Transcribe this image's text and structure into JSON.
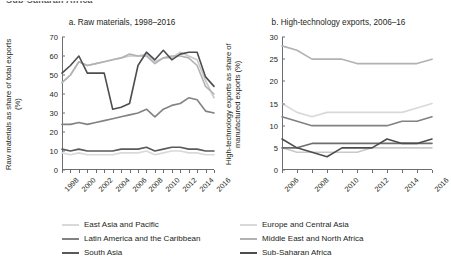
{
  "header": {
    "cropped_text": "Sub-Saharan Africa"
  },
  "chart_data": [
    {
      "type": "line",
      "panel": "a",
      "title": "a. Raw materials, 1998–2016",
      "xlabel": "",
      "ylabel": "Raw materials as share of total exports (%)",
      "ylim": [
        0,
        70
      ],
      "yticks": [
        0,
        10,
        20,
        30,
        40,
        50,
        60,
        70
      ],
      "xlim": [
        1998,
        2016
      ],
      "xticks": [
        1998,
        2000,
        2002,
        2004,
        2006,
        2008,
        2010,
        2012,
        2014,
        2016
      ],
      "x": [
        1998,
        1999,
        2000,
        2001,
        2002,
        2003,
        2004,
        2005,
        2006,
        2007,
        2008,
        2009,
        2010,
        2011,
        2012,
        2013,
        2014,
        2015,
        2016
      ],
      "grid": false,
      "legend_position": "bottom",
      "series": [
        {
          "name": "East Asia and Pacific",
          "color": "#d9d9d9",
          "values": [
            9,
            8,
            9,
            8,
            8,
            8,
            8,
            9,
            9,
            9,
            10,
            8,
            9,
            10,
            10,
            9,
            9,
            8,
            8
          ]
        },
        {
          "name": "Europe and Central Asia",
          "color": "#c8c9ca",
          "values": [
            46,
            50,
            57,
            55,
            56,
            57,
            58,
            59,
            60,
            60,
            61,
            57,
            59,
            59,
            62,
            60,
            58,
            47,
            38
          ]
        },
        {
          "name": "Latin America and the Caribbean",
          "color": "#808285",
          "values": [
            24,
            24,
            25,
            24,
            25,
            26,
            27,
            28,
            29,
            30,
            32,
            28,
            32,
            34,
            35,
            38,
            37,
            31,
            30
          ]
        },
        {
          "name": "Middle East and North Africa",
          "color": "#b0b2b4",
          "values": [
            46,
            50,
            57,
            55,
            56,
            57,
            58,
            59,
            61,
            60,
            60,
            56,
            59,
            60,
            60,
            59,
            55,
            44,
            40
          ]
        },
        {
          "name": "South Asia",
          "color": "#58595b",
          "values": [
            11,
            10,
            11,
            10,
            10,
            10,
            10,
            11,
            11,
            11,
            12,
            10,
            11,
            12,
            12,
            11,
            11,
            10,
            10
          ]
        },
        {
          "name": "Sub-Saharan Africa",
          "color": "#4d4d4f",
          "values": [
            51,
            55,
            60,
            51,
            51,
            51,
            32,
            33,
            35,
            55,
            62,
            58,
            63,
            58,
            61,
            62,
            62,
            49,
            44
          ]
        }
      ]
    },
    {
      "type": "line",
      "panel": "b",
      "title": "b. High-technology exports, 2006–16",
      "xlabel": "",
      "ylabel": "High-technology exports as share of manufactured exports (%)",
      "ylim": [
        0,
        30
      ],
      "yticks": [
        0,
        5,
        10,
        15,
        20,
        25,
        30
      ],
      "xlim": [
        2006,
        2016
      ],
      "xticks": [
        2006,
        2008,
        2010,
        2012,
        2014,
        2016
      ],
      "x": [
        2006,
        2007,
        2008,
        2009,
        2010,
        2011,
        2012,
        2013,
        2014,
        2015,
        2016
      ],
      "grid": false,
      "legend_position": "bottom",
      "series": [
        {
          "name": "East Asia and Pacific",
          "color": "#b0b2b4",
          "values": [
            28,
            27,
            25,
            25,
            25,
            24,
            24,
            24,
            24,
            24,
            25
          ]
        },
        {
          "name": "Europe and Central Asia",
          "color": "#d9d9d9",
          "values": [
            15,
            13,
            12,
            13,
            13,
            13,
            13,
            13,
            13,
            14,
            15
          ]
        },
        {
          "name": "Latin America and the Caribbean",
          "color": "#808285",
          "values": [
            12,
            11,
            10,
            10,
            10,
            10,
            10,
            10,
            11,
            11,
            12
          ]
        },
        {
          "name": "Middle East and North Africa",
          "color": "#c8c9ca",
          "values": [
            5,
            4,
            4,
            4,
            4,
            4,
            5,
            5,
            5,
            5,
            5
          ]
        },
        {
          "name": "South Asia",
          "color": "#6d6e71",
          "values": [
            5,
            5,
            6,
            6,
            6,
            6,
            6,
            6,
            6,
            6,
            6
          ]
        },
        {
          "name": "Sub-Saharan Africa",
          "color": "#4d4d4f",
          "values": [
            7,
            5,
            4,
            3,
            5,
            5,
            5,
            7,
            6,
            6,
            7
          ]
        }
      ]
    }
  ],
  "legend": {
    "items": [
      {
        "label": "East Asia and Pacific",
        "color": "#d9d9d9"
      },
      {
        "label": "Europe and Central Asia",
        "color": "#d9d9d9"
      },
      {
        "label": "Latin America and the Caribbean",
        "color": "#808285"
      },
      {
        "label": "Middle East and North Africa",
        "color": "#b0b2b4"
      },
      {
        "label": "South Asia",
        "color": "#58595b"
      },
      {
        "label": "Sub-Saharan Africa",
        "color": "#4d4d4f"
      }
    ]
  }
}
